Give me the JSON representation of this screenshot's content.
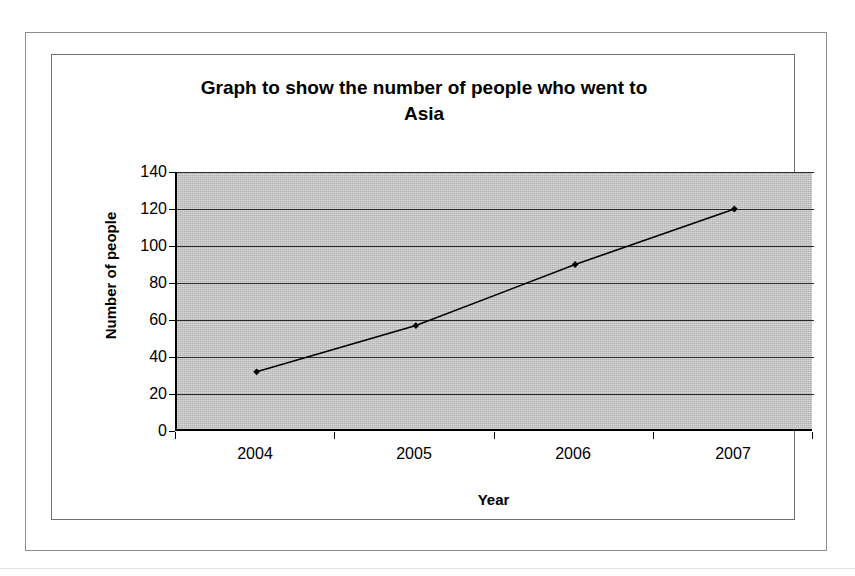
{
  "chart_data": {
    "type": "line",
    "title": "Graph to show the number of people who went to Asia",
    "title_line1": "Graph to show the number of people who went to",
    "title_line2": "Asia",
    "xlabel": "Year",
    "ylabel": "Number of people",
    "categories": [
      "2004",
      "2005",
      "2006",
      "2007"
    ],
    "values": [
      32,
      57,
      90,
      120
    ],
    "series": [
      {
        "name": "Number of people",
        "values": [
          32,
          57,
          90,
          120
        ]
      }
    ],
    "ylim": [
      0,
      140
    ],
    "y_ticks": [
      0,
      20,
      40,
      60,
      80,
      100,
      120,
      140
    ],
    "y_tick_labels": [
      "0",
      "20",
      "40",
      "60",
      "80",
      "100",
      "120",
      "140"
    ],
    "grid": "horizontal",
    "legend": "none",
    "plot_background_color": "#b3b3b3",
    "line_color": "#000000",
    "marker": "diamond",
    "marker_color": "#000000"
  }
}
